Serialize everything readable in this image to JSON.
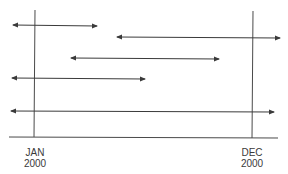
{
  "diagram": {
    "type": "timeline-interval-diagram",
    "markers": [
      {
        "line1": "JAN",
        "line2": "2000",
        "x": 35
      },
      {
        "line1": "DEC",
        "line2": "2000",
        "x": 252
      }
    ],
    "intervals": [
      {
        "y": 25,
        "x1": 13,
        "x2": 97
      },
      {
        "y": 37,
        "x1": 117,
        "x2": 280
      },
      {
        "y": 58,
        "x1": 71,
        "x2": 219
      },
      {
        "y": 78,
        "x1": 12,
        "x2": 145
      },
      {
        "y": 111,
        "x1": 11,
        "x2": 274
      }
    ],
    "colors": {
      "line": "#3a3a3a",
      "background": "#ffffff"
    }
  }
}
